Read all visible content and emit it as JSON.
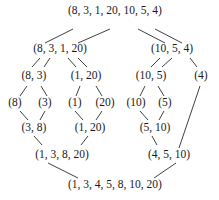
{
  "diagram": {
    "type": "merge-sort-tree",
    "nodes": {
      "root": {
        "label": "(8, 3, 1, 20, 10, 5, 4)",
        "x": 115,
        "y": 8
      },
      "l": {
        "label": "(8, 3, 1, 20)",
        "x": 60,
        "y": 46
      },
      "r": {
        "label": "(10, 5, 4)",
        "x": 172,
        "y": 46
      },
      "ll": {
        "label": "(8, 3)",
        "x": 34,
        "y": 73
      },
      "lr": {
        "label": "(1, 20)",
        "x": 86,
        "y": 73
      },
      "rl": {
        "label": "(10, 5)",
        "x": 151,
        "y": 73
      },
      "rr": {
        "label": "(4)",
        "x": 201,
        "y": 73
      },
      "lll": {
        "label": "(8)",
        "x": 15,
        "y": 100
      },
      "llr": {
        "label": "(3)",
        "x": 45,
        "y": 100
      },
      "lrl": {
        "label": "(1)",
        "x": 75,
        "y": 100
      },
      "lrr": {
        "label": "(20)",
        "x": 105,
        "y": 100
      },
      "rll": {
        "label": "(10)",
        "x": 136,
        "y": 100
      },
      "rlr": {
        "label": "(5)",
        "x": 165,
        "y": 100
      },
      "m_ll": {
        "label": "(3, 8)",
        "x": 34,
        "y": 125
      },
      "m_lr": {
        "label": "(1, 20)",
        "x": 90,
        "y": 125
      },
      "m_rl": {
        "label": "(5, 10)",
        "x": 155,
        "y": 125
      },
      "m_l": {
        "label": "(1, 3, 8, 20)",
        "x": 62,
        "y": 152
      },
      "m_r": {
        "label": "(4, 5, 10)",
        "x": 169,
        "y": 152
      },
      "result": {
        "label": "(1, 3, 4, 5, 8, 10, 20)",
        "x": 115,
        "y": 182
      }
    },
    "edges": [
      [
        73,
        29,
        45,
        43
      ],
      [
        110,
        29,
        78,
        43
      ],
      [
        138,
        29,
        165,
        43
      ],
      [
        155,
        29,
        182,
        43
      ],
      [
        40,
        58,
        32,
        67
      ],
      [
        50,
        58,
        44,
        67
      ],
      [
        68,
        58,
        76,
        67
      ],
      [
        78,
        58,
        87,
        67
      ],
      [
        160,
        58,
        151,
        67
      ],
      [
        172,
        58,
        162,
        67
      ],
      [
        190,
        58,
        197,
        67
      ],
      [
        27,
        86,
        20,
        96
      ],
      [
        41,
        86,
        47,
        96
      ],
      [
        80,
        86,
        76,
        96
      ],
      [
        96,
        86,
        102,
        96
      ],
      [
        145,
        86,
        140,
        96
      ],
      [
        158,
        86,
        164,
        96
      ],
      [
        200,
        86,
        179,
        148
      ],
      [
        20,
        111,
        28,
        120
      ],
      [
        45,
        111,
        40,
        120
      ],
      [
        75,
        111,
        83,
        120
      ],
      [
        102,
        111,
        96,
        120
      ],
      [
        140,
        111,
        148,
        120
      ],
      [
        164,
        111,
        159,
        120
      ],
      [
        34,
        136,
        42,
        145
      ],
      [
        88,
        136,
        81,
        145
      ],
      [
        152,
        136,
        157,
        145
      ],
      [
        48,
        163,
        78,
        178
      ],
      [
        176,
        163,
        154,
        178
      ]
    ]
  }
}
